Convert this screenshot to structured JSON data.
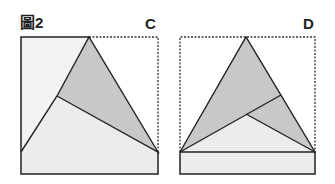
{
  "figure": {
    "title": "圖2",
    "panels": [
      {
        "label": "C"
      },
      {
        "label": "D"
      }
    ]
  },
  "colors": {
    "dark_fill": "#c8c8c8",
    "light_fill": "#ececec",
    "lighter_fill": "#f3f3f3",
    "stroke": "#222222"
  }
}
